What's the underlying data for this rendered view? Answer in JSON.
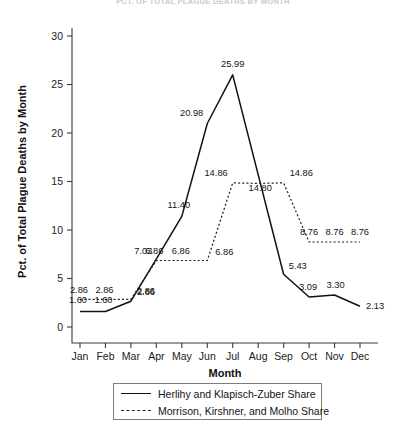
{
  "chart_data": {
    "type": "line",
    "title": "PCT. OF TOTAL PLAGUE DEATHS BY MONTH",
    "xlabel": "Month",
    "ylabel": "Pct. of Total Plague Deaths by Month",
    "categories": [
      "Jan",
      "Feb",
      "Mar",
      "Apr",
      "May",
      "Jun",
      "Jul",
      "Aug",
      "Sep",
      "Oct",
      "Nov",
      "Dec"
    ],
    "ylim": [
      0,
      30
    ],
    "yticks": [
      0,
      5,
      10,
      15,
      20,
      25,
      30
    ],
    "grid": false,
    "legend_position": "bottom",
    "series": [
      {
        "name": "Herlihy and Klapisch-Zuber Share",
        "style": "solid",
        "values": [
          1.6,
          1.6,
          2.66,
          7.03,
          11.4,
          20.98,
          25.99,
          null,
          5.43,
          3.09,
          3.3,
          2.13
        ],
        "labels": [
          "1.60",
          "1.60",
          "2.66",
          "7.03",
          "11.40",
          "20.98",
          "25.99",
          "",
          "5.43",
          "3.09",
          "3.30",
          "2.13"
        ]
      },
      {
        "name": "Morrison, Kirshner, and Molho Share",
        "style": "dashed",
        "values": [
          2.86,
          2.86,
          2.86,
          6.86,
          6.86,
          6.86,
          14.86,
          14.8,
          14.86,
          8.76,
          8.76,
          8.76
        ],
        "labels": [
          "2.86",
          "2.86",
          "2.86",
          "6.86",
          "6.86",
          "6.86",
          "14.86",
          "14.80",
          "14.86",
          "8.76",
          "8.76",
          "8.76"
        ]
      }
    ]
  },
  "legend": {
    "entries": [
      {
        "label": "Herlihy and Klapisch-Zuber Share",
        "style": "solid"
      },
      {
        "label": "Morrison, Kirshner, and Molho Share",
        "style": "dashed"
      }
    ]
  }
}
